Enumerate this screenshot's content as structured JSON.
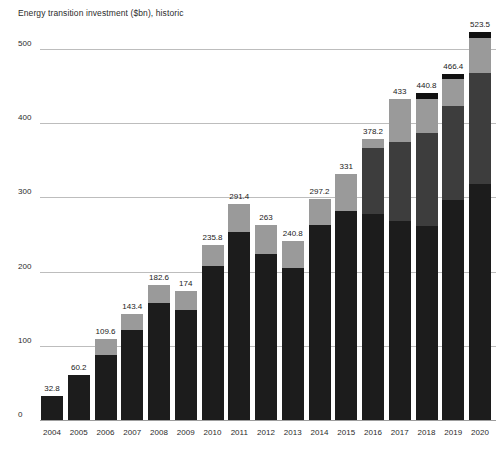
{
  "chart_data": {
    "type": "bar",
    "title": "Energy transition investment ($bn), historic",
    "xlabel": "",
    "ylabel": "",
    "ylim": [
      0,
      500
    ],
    "yticks": [
      0,
      100,
      200,
      300,
      400,
      500
    ],
    "ytick_labels": [
      "0",
      "100",
      "200",
      "300",
      "400",
      "500"
    ],
    "grid": true,
    "legend": "none",
    "stacked": true,
    "categories": [
      "2004",
      "2005",
      "2006",
      "2007",
      "2008",
      "2009",
      "2010",
      "2011",
      "2012",
      "2013",
      "2014",
      "2015",
      "2016",
      "2017",
      "2018",
      "2019",
      "2020"
    ],
    "totals": [
      32.8,
      60.2,
      109.6,
      143.4,
      182.6,
      174,
      235.8,
      291.4,
      263,
      240.8,
      297.2,
      331,
      378.2,
      433,
      440.8,
      466.4,
      523.5
    ],
    "total_labels": [
      "32.8",
      "60.2",
      "109.6",
      "143.4",
      "182.6",
      "174",
      "235.8",
      "291.4",
      "263",
      "240.8",
      "297.2",
      "331",
      "378.2",
      "433",
      "440.8",
      "466.4",
      "523.5"
    ],
    "segments": [
      {
        "values": [
          32.8,
          60.2,
          87.0,
          121.0,
          158.0,
          148.0,
          207.0,
          254.0,
          224.0,
          205.0,
          263.0,
          282.0,
          277.0,
          268.0,
          262.0,
          297.0,
          318.0
        ]
      },
      {
        "values": [
          0,
          0,
          0,
          0,
          0,
          0,
          0,
          0,
          0,
          0,
          0,
          0,
          90.0,
          107.0,
          125.0,
          126.0,
          149.0
        ]
      },
      {
        "values": [
          0,
          0,
          22.6,
          22.4,
          24.6,
          26.0,
          28.8,
          37.4,
          39.0,
          35.8,
          34.2,
          49.0,
          11.2,
          58.0,
          46.0,
          36.0,
          48.0
        ]
      },
      {
        "values": [
          0,
          0,
          0,
          0,
          0,
          0,
          0,
          0,
          0,
          0,
          0,
          0,
          0,
          0,
          7.8,
          7.4,
          8.5
        ]
      }
    ],
    "colors": {
      "segment_0": "#1c1c1c",
      "segment_1": "#3d3d3d",
      "segment_2": "#9a9a9a",
      "segment_3": "#111111",
      "gridline": "#bdbdbd",
      "baseline": "#9d9d9d",
      "text": "#2b2b2b",
      "background": "#ffffff"
    }
  }
}
